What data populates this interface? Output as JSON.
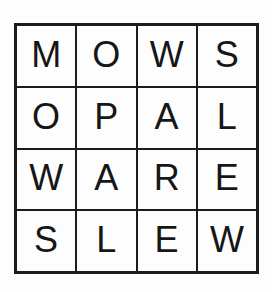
{
  "puzzle": {
    "title": "Word Square Grid",
    "type": "word-square",
    "rows": 4,
    "columns": 4,
    "colors": {
      "background": "#fdfdfd",
      "grid_line": "#1c1c1c",
      "cell_background": "#fdfdfd",
      "letter": "#161616"
    },
    "grid": [
      [
        "M",
        "O",
        "W",
        "S"
      ],
      [
        "O",
        "P",
        "A",
        "L"
      ],
      [
        "W",
        "A",
        "R",
        "E"
      ],
      [
        "S",
        "L",
        "E",
        "W"
      ]
    ],
    "row_words": [
      "MOWS",
      "OPAL",
      "WARE",
      "SLEW"
    ],
    "column_words": [
      "MOWS",
      "OPAL",
      "WARE",
      "SLEW"
    ]
  }
}
